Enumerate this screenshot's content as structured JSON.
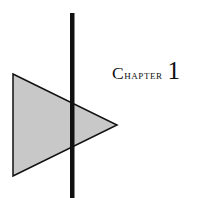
{
  "page": {
    "width": 221,
    "height": 198,
    "background_color": "#ffffff",
    "kind": "book-chapter-opener"
  },
  "heading": {
    "label_first_letter": "C",
    "label_rest": "hapter",
    "number": "1",
    "text_color": "#101010",
    "style": "small-caps-serif"
  },
  "decoration": {
    "triangle": {
      "name": "gray-triangle",
      "fill_color": "#c8c8c8",
      "stroke_color": "#111111",
      "stroke_width": 1.5,
      "points": "13,74 117,125 13,176"
    },
    "vertical_rule": {
      "name": "vertical-black-rule",
      "color": "#111111",
      "x": 70,
      "y_top": 13,
      "y_bottom": 198,
      "width": 4.5
    }
  }
}
